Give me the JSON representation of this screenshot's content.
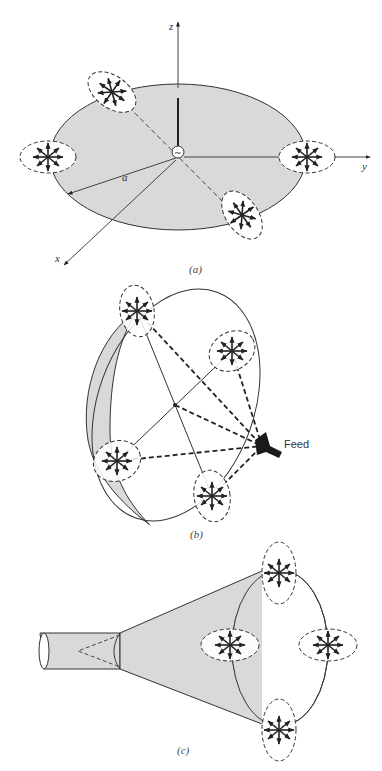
{
  "figure": {
    "colors": {
      "stroke": "#333333",
      "fill_gray": "#d9d9d9",
      "background": "#ffffff"
    },
    "panels": [
      {
        "id": "a",
        "caption": "(a)",
        "description": "Circular loop/disk in xy-plane with source at center; four polarization clusters (dashed ellipses with radiating arrows) at rim",
        "axes": {
          "x": "x",
          "y": "y",
          "z": "z"
        },
        "radius_label": "a",
        "source_symbol": "~"
      },
      {
        "id": "b",
        "caption": "(b)",
        "description": "Parabolic reflector with feed; four polarization clusters at rim connected to feed by dashed ray lines",
        "feed_label": "Feed"
      },
      {
        "id": "c",
        "caption": "(c)",
        "description": "Conical horn fed by circular waveguide; four polarization clusters at horn aperture"
      }
    ]
  }
}
